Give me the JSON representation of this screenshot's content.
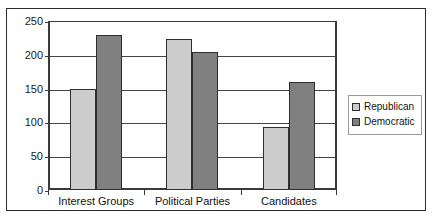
{
  "figure": {
    "top_scan_text": "· ·   · ·· · ··  · · ···",
    "border_color": "#2b2b2b",
    "background": "#ffffff"
  },
  "legend": {
    "position": "right",
    "entries": [
      {
        "label": "Republican",
        "color": "#cccccc",
        "swatch_name": "legend-swatch-republican"
      },
      {
        "label": "Democratic",
        "color": "#808080",
        "swatch_name": "legend-swatch-democratic"
      }
    ]
  },
  "axis": {
    "y_ticks": [
      "250",
      "200",
      "150",
      "100",
      "50",
      "0"
    ],
    "x_categories": [
      "Interest Groups",
      "Political Parties",
      "Candidates"
    ]
  },
  "chart_data": {
    "type": "bar",
    "title": "",
    "subtitle": "",
    "xlabel": "",
    "ylabel": "",
    "categories": [
      "Interest Groups",
      "Political Parties",
      "Candidates"
    ],
    "series": [
      {
        "name": "Republican",
        "color": "#cccccc",
        "values": [
          150,
          223,
          93
        ]
      },
      {
        "name": "Democratic",
        "color": "#808080",
        "values": [
          230,
          204,
          160
        ]
      }
    ],
    "ylim": [
      0,
      250
    ],
    "ytick_step": 50,
    "ytick_values": [
      0,
      50,
      100,
      150,
      200,
      250
    ],
    "grid": true,
    "grid_axis": "y",
    "legend_position": "right",
    "bar_border_color": "#2e2e2e",
    "annotations": []
  }
}
